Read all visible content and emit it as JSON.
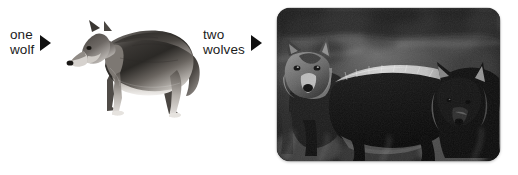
{
  "canvas": {
    "width": 518,
    "height": 175,
    "background": "#ffffff"
  },
  "figure": {
    "kind": "singular-plural-illustration",
    "subject": "wolf"
  },
  "labels": [
    {
      "id": "one-wolf",
      "line1": "one",
      "line2": "wolf",
      "arrow": "right-triangle-arrow",
      "color": "#1c1c1c"
    },
    {
      "id": "two-wolves",
      "line1": "two",
      "line2": "wolves",
      "arrow": "right-triangle-arrow",
      "color": "#1c1c1c"
    }
  ],
  "images": [
    {
      "id": "single-wolf-cutout",
      "alt": "one wolf",
      "style": "grayscale cut-out, no background",
      "count": 1
    },
    {
      "id": "two-wolves-photo",
      "alt": "two wolves",
      "style": "black-and-white photograph, rounded corners, drop shadow",
      "count": 2
    }
  ],
  "colors": {
    "text": "#1c1c1c",
    "arrow": "#101010",
    "background": "#ffffff",
    "photo_dark": "#0e0e0e",
    "photo_light": "#e8e8e8"
  }
}
